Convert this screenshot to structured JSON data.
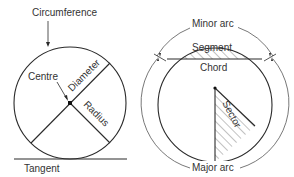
{
  "left_diagram": {
    "labels": {
      "circumference": "Circumference",
      "centre": "Centre",
      "diameter": "Diameter",
      "radius": "Radius",
      "tangent": "Tangent"
    }
  },
  "right_diagram": {
    "labels": {
      "minor_arc": "Minor arc",
      "segment": "Segment",
      "chord": "Chord",
      "sector": "Sector",
      "major_arc": "Major arc"
    }
  },
  "colors": {
    "line": "#2a2a2a",
    "hatch": "#555555",
    "text": "#333333"
  }
}
